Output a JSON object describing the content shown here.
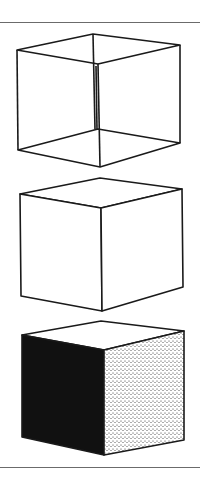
{
  "figure": {
    "colors": {
      "stroke": "#1a1a1a",
      "rule": "#6b6b6b",
      "dark_face": "#111111",
      "stipple": "#222222",
      "background": "#ffffff"
    },
    "cubes": [
      {
        "name": "wireframe-cube",
        "style": "transparent wireframe (Necker cube)"
      },
      {
        "name": "outline-cube",
        "style": "opaque line drawing"
      },
      {
        "name": "shaded-cube",
        "style": "shaded: black left face, stippled right face, white top"
      }
    ]
  }
}
